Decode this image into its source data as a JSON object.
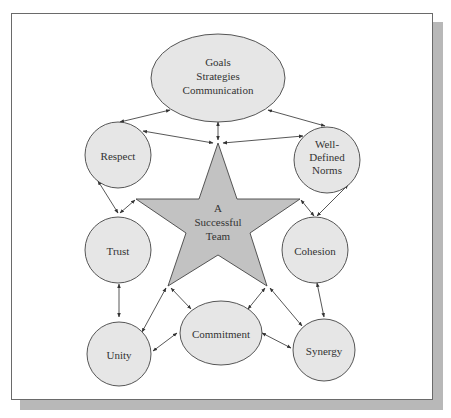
{
  "diagram": {
    "center": {
      "lines": [
        "A",
        "Successful",
        "Team"
      ],
      "shape": "star",
      "fill": "#c2c2c2"
    },
    "nodes": [
      {
        "id": "goals",
        "lines": [
          "Goals",
          "Strategies",
          "Communication"
        ]
      },
      {
        "id": "respect",
        "lines": [
          "Respect"
        ]
      },
      {
        "id": "norms",
        "lines": [
          "Well-",
          "Defined",
          "Norms"
        ]
      },
      {
        "id": "trust",
        "lines": [
          "Trust"
        ]
      },
      {
        "id": "cohesion",
        "lines": [
          "Cohesion"
        ]
      },
      {
        "id": "unity",
        "lines": [
          "Unity"
        ]
      },
      {
        "id": "commitment",
        "lines": [
          "Commitment"
        ]
      },
      {
        "id": "synergy",
        "lines": [
          "Synergy"
        ]
      }
    ],
    "node_fill": "#e6e6e6",
    "stroke": "#444444"
  }
}
